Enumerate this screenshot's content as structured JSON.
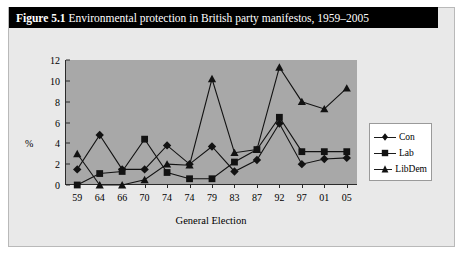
{
  "figure": {
    "number": "Figure 5.1",
    "caption": " Environmental protection in British party manifestos, 1959–2005"
  },
  "legend": {
    "position": "right",
    "entries": [
      {
        "label": "Con",
        "marker": "diamond"
      },
      {
        "label": "Lab",
        "marker": "square"
      },
      {
        "label": "LibDem",
        "marker": "triangle"
      }
    ]
  },
  "chart_data": {
    "type": "line",
    "title": "Environmental protection in British party manifestos, 1959–2005",
    "xlabel": "General Election",
    "ylabel": "%",
    "categories": [
      "59",
      "64",
      "66",
      "70",
      "74",
      "74",
      "79",
      "83",
      "87",
      "92",
      "97",
      "01",
      "05"
    ],
    "ylim": [
      0,
      12
    ],
    "yticks": [
      0,
      2,
      4,
      6,
      8,
      10,
      12
    ],
    "grid": false,
    "series": [
      {
        "name": "Con",
        "marker": "diamond",
        "values": [
          1.5,
          4.8,
          1.5,
          1.5,
          3.8,
          2.0,
          3.7,
          1.3,
          2.4,
          5.9,
          2.0,
          2.5,
          2.6
        ]
      },
      {
        "name": "Lab",
        "marker": "square",
        "values": [
          0.0,
          1.1,
          1.3,
          4.4,
          1.2,
          0.6,
          0.6,
          2.2,
          3.4,
          6.5,
          3.2,
          3.2,
          3.2
        ]
      },
      {
        "name": "LibDem",
        "marker": "triangle",
        "values": [
          3.0,
          0.0,
          0.0,
          0.5,
          2.0,
          1.9,
          10.2,
          3.1,
          3.4,
          11.3,
          8.0,
          7.3,
          9.3
        ]
      }
    ]
  }
}
